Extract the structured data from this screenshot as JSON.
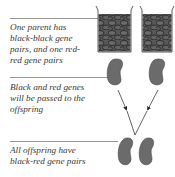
{
  "captions": [
    {
      "id": "parents",
      "text_lines": [
        "One parent has",
        "black-black gene",
        "pairs, and one red-",
        "red gene pairs"
      ]
    },
    {
      "id": "passing",
      "text_lines": [
        "Black and red genes",
        "will be passed to the",
        "offspring"
      ]
    },
    {
      "id": "offspring",
      "text_lines": [
        "All offspring have",
        "black-red gene pairs"
      ]
    }
  ],
  "illustration": {
    "parents": [
      {
        "name": "black-bean-jar",
        "bean_color": "#5a5a5a"
      },
      {
        "name": "red-bean-jar",
        "bean_color": "#5a5a5a"
      }
    ],
    "gametes": [
      "black-gene-bean",
      "red-gene-bean"
    ],
    "offspring": [
      "black-gene-bean",
      "red-gene-bean"
    ]
  },
  "colors": {
    "text": "#3a3a3a",
    "rule": "#9a9a9a",
    "bean_fill": "#6b6b6b",
    "jar_fill": "#585858",
    "outline": "#222222"
  }
}
